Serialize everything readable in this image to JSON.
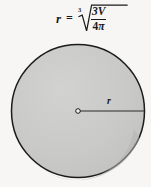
{
  "figure": {
    "background_color": "#f7f6f4"
  },
  "formula": {
    "variable": "r",
    "equals": "=",
    "radical_index": "3",
    "numerator": "3V",
    "denominator_number": "4",
    "denominator_symbol": "π",
    "plain_text": "r = cube root of (3V / 4π)"
  },
  "circle": {
    "center_x": 78,
    "center_y": 111,
    "radius": 67,
    "fill_color": "#c9c9c7",
    "shade_color": "#bdbdbb",
    "stroke_color": "#1b1b1b",
    "stroke_width": 1.4
  },
  "radius_line": {
    "label": "r",
    "from_x": 78,
    "from_y": 111,
    "to_x": 144,
    "to_y": 111,
    "color": "#2a2a2a"
  },
  "center_dot": {
    "label": "center-point",
    "radius": 2.2,
    "fill_color": "#f7f6f4",
    "stroke_color": "#1b1b1b"
  }
}
